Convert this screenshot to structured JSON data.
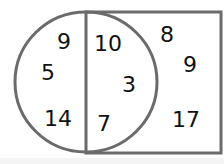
{
  "diagram": {
    "type": "venn",
    "stroke_color": "#6b6b6b",
    "circle_only": [
      "9",
      "5",
      "14"
    ],
    "intersection": [
      "10",
      "3",
      "7"
    ],
    "rectangle_only": [
      "8",
      "9",
      "17"
    ]
  }
}
